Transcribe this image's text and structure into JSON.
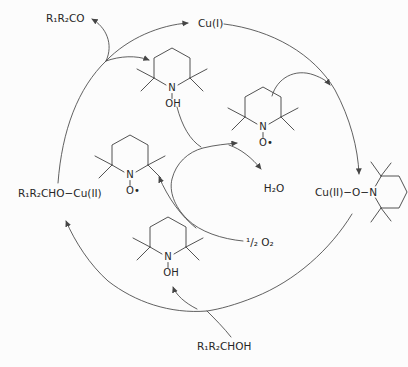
{
  "figure": {
    "colors": {
      "background": "#fcfcfc",
      "line": "#454545",
      "text": "#262626"
    }
  },
  "species": {
    "ketone": "R₁R₂CO",
    "cu_i": "Cu(I)",
    "cu_ii_alkoxide": "R₁R₂CHO−Cu(II)",
    "water": "H₂O",
    "cu_ii_tempo": "Cu(II)−O−N",
    "half_o2": "¹/₂ O₂",
    "alcohol": "R₁R₂CHOH"
  },
  "ring_labels": {
    "n": "N",
    "oh": "OH",
    "o_radical": "O•"
  }
}
